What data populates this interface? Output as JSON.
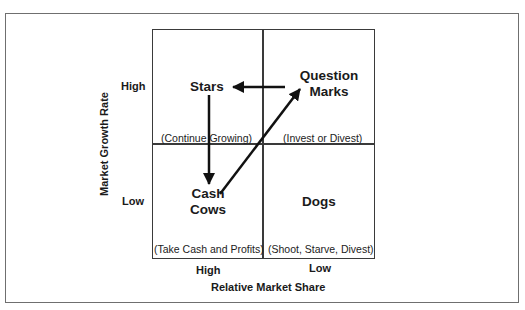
{
  "diagram": {
    "type": "bcg-growth-share-matrix",
    "y_axis": {
      "label": "Market Growth Rate",
      "high": "High",
      "low": "Low"
    },
    "x_axis": {
      "label": "Relative Market Share",
      "high": "High",
      "low": "Low"
    },
    "quadrants": {
      "top_left": {
        "title": "Stars",
        "note": "(Continue Growing)"
      },
      "top_right": {
        "title_line1": "Question",
        "title_line2": "Marks",
        "note": "(Invest or Divest)"
      },
      "bottom_left": {
        "title_line1": "Cash",
        "title_line2": "Cows",
        "note": "(Take Cash and Profits)"
      },
      "bottom_right": {
        "title": "Dogs",
        "note": "(Shoot, Starve, Divest)"
      }
    },
    "arrows": [
      {
        "from": "Question Marks",
        "to": "Stars"
      },
      {
        "from": "Stars",
        "to": "Cash Cows"
      },
      {
        "from": "Cash Cows",
        "to": "Question Marks"
      }
    ],
    "colors": {
      "line": "#3a3a3a",
      "frame": "#6f6f6f",
      "text": "#1a1a1a"
    }
  }
}
